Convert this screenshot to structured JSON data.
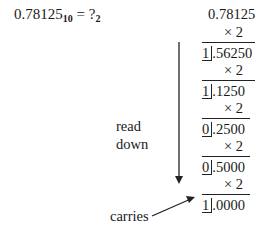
{
  "equation": {
    "base_value": "0.78125",
    "base_from": "10",
    "equals": " = ?",
    "base_to": "2"
  },
  "computation": {
    "start": "0.78125",
    "multiplier": "× 2",
    "steps": [
      {
        "carry": "1",
        "fraction": ".56250"
      },
      {
        "carry": "1",
        "fraction": ".1250"
      },
      {
        "carry": "0",
        "fraction": ".2500"
      },
      {
        "carry": "0",
        "fraction": ".5000"
      },
      {
        "carry": "1",
        "fraction": ".0000"
      }
    ]
  },
  "labels": {
    "read": "read",
    "down": "down",
    "carries": "carries"
  }
}
